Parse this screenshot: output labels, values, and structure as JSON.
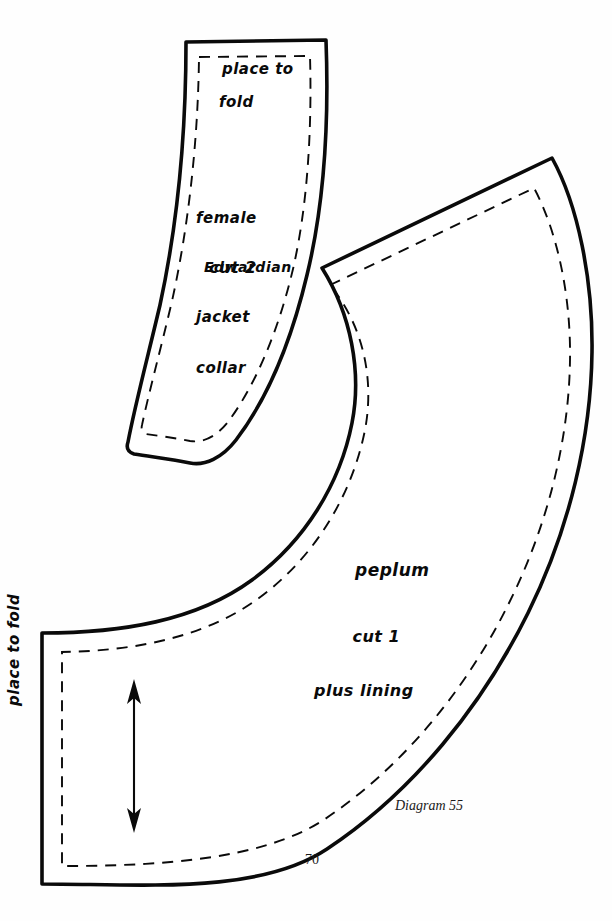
{
  "page": {
    "number": "70",
    "caption": "Diagram 55",
    "background_color": "#fefefe",
    "ink_color": "#0a0a0a"
  },
  "pieces": [
    {
      "id": "collar",
      "name": "female Edwardian jacket collar",
      "fold_label": {
        "line1": "place to",
        "line2": "fold"
      },
      "name_lines": [
        "female",
        "Edwardian",
        "jacket",
        "collar"
      ],
      "cut_label": "cut 2",
      "has_seam_allowance_line": true,
      "grainline": false
    },
    {
      "id": "peplum",
      "name": "peplum",
      "name_label": "peplum",
      "cut_lines": [
        "cut 1",
        "plus lining"
      ],
      "fold_label": "place to fold",
      "has_seam_allowance_line": true,
      "grainline": true
    }
  ]
}
